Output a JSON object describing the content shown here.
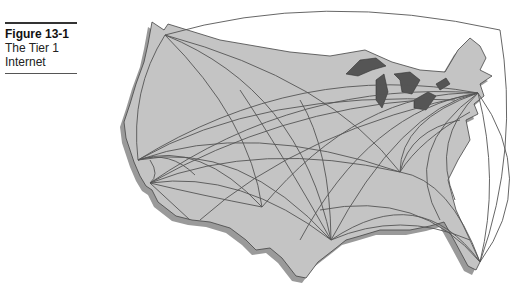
{
  "caption": {
    "figure_label": "Figure 13-1",
    "title_line1": "The Tier 1",
    "title_line2": "Internet"
  },
  "map": {
    "land_color": "#c4c4c4",
    "shadow_color": "#9a9a9a",
    "lakes_color": "#555555",
    "link_color": "#555555",
    "nodes": [
      "seattle",
      "san-francisco",
      "los-angeles",
      "phoenix",
      "denver",
      "dallas",
      "houston",
      "chicago",
      "atlanta",
      "new-york-dc",
      "miami"
    ]
  }
}
